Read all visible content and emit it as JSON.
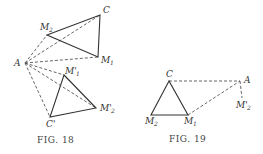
{
  "figures": [
    {
      "caption": "FIG. 18",
      "points": {
        "A": {
          "label": "A",
          "sub": "",
          "x": 25,
          "y": 63
        },
        "C": {
          "label": "C",
          "sub": "",
          "x": 100,
          "y": 15
        },
        "M2": {
          "label": "M",
          "sub": "2",
          "x": 47,
          "y": 35
        },
        "M1": {
          "label": "M",
          "sub": "1",
          "x": 98,
          "y": 57
        },
        "Mp1": {
          "label": "M'",
          "sub": "1",
          "x": 64,
          "y": 75
        },
        "Mp2": {
          "label": "M'",
          "sub": "2",
          "x": 96,
          "y": 108
        },
        "Cp": {
          "label": "C'",
          "sub": "",
          "x": 50,
          "y": 117
        }
      },
      "solid_segments": [
        [
          "M2",
          "C"
        ],
        [
          "C",
          "M1"
        ],
        [
          "M2",
          "M1"
        ],
        [
          "Mp1",
          "Mp2"
        ],
        [
          "Mp2",
          "Cp"
        ],
        [
          "Cp",
          "Mp1"
        ]
      ],
      "dashed_segments": [
        [
          "A",
          "M2"
        ],
        [
          "A",
          "C"
        ],
        [
          "A",
          "M1"
        ],
        [
          "A",
          "Mp1"
        ],
        [
          "A",
          "Mp2"
        ],
        [
          "A",
          "Cp"
        ]
      ]
    },
    {
      "caption": "FIG. 19",
      "points": {
        "C": {
          "label": "C",
          "sub": "",
          "x": 169,
          "y": 81
        },
        "A": {
          "label": "A",
          "sub": "",
          "x": 240,
          "y": 81
        },
        "Mp2": {
          "label": "M'",
          "sub": "2",
          "x": 242,
          "y": 100
        },
        "M2": {
          "label": "M",
          "sub": "2",
          "x": 151,
          "y": 115
        },
        "M1": {
          "label": "M",
          "sub": "1",
          "x": 188,
          "y": 115
        }
      },
      "solid_segments": [
        [
          "C",
          "M2"
        ],
        [
          "M2",
          "M1"
        ],
        [
          "M1",
          "C"
        ]
      ],
      "dashed_segments": [
        [
          "C",
          "A"
        ],
        [
          "M1",
          "A"
        ],
        [
          "A",
          "Mp2"
        ]
      ]
    }
  ]
}
